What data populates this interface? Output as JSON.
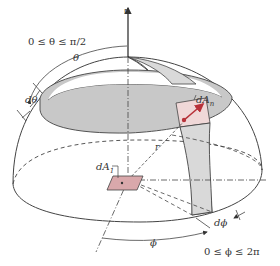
{
  "figure": {
    "type": "hemisphere-solid-angle-diagram",
    "labels": {
      "normal": "n",
      "theta_range": "0 ≤ θ ≤ π/2",
      "theta": "θ",
      "d_theta": "dθ",
      "dA_n": "dA",
      "dA_n_sub": "n",
      "dA_1": "dA",
      "dA_1_sub": "1",
      "r": "r",
      "phi": "ϕ",
      "d_phi": "dϕ",
      "phi_range": "0 ≤ ϕ ≤ 2π"
    },
    "colors": {
      "band_fill": "#c8c8c8",
      "meridian_fill": "#d9d9d9",
      "intersection_fill": "#f0d8d8",
      "dA1_fill": "#d9a8ab",
      "arrow_red": "#b8323a",
      "line": "#444444"
    }
  }
}
